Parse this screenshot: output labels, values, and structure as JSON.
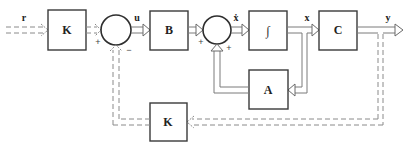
{
  "diagram": {
    "blocks": {
      "k_forward": "K",
      "b": "B",
      "integrator": "∫",
      "c": "C",
      "a": "A",
      "k_feedback": "K"
    },
    "signals": {
      "r": "r",
      "u": "u",
      "x_dot": "ẋ",
      "x": "x",
      "y": "y"
    },
    "summing_junction_1": {
      "left_sign": "+",
      "bottom_sign": "−"
    },
    "summing_junction_2": {
      "left_sign": "+",
      "bottom_sign": "+"
    }
  }
}
